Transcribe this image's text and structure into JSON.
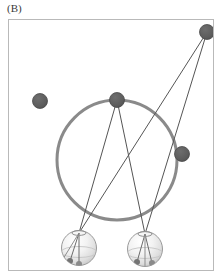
{
  "panel": {
    "label": "(B)",
    "frame": {
      "x": 8,
      "y": 19,
      "width": 206,
      "height": 252,
      "border_color": "#b9b9b9"
    },
    "background_color": "#ffffff"
  },
  "colors": {
    "ring": "#8a8a8a",
    "node_dark": "#5a5a5a",
    "node_dark_stroke": "#4a4a4a",
    "line": "#555555",
    "sphere_light": "#ffffff",
    "sphere_mid": "#e8e8e8",
    "sphere_shadow": "#bdbdbd",
    "sphere_outline": "#9a9a9a",
    "marker_dark": "#707070"
  },
  "ring": {
    "name": "gray-ring",
    "cx": 117,
    "cy": 160,
    "r": 60,
    "stroke_width": 3
  },
  "nodes": [
    {
      "id": "node-isolated-left",
      "label": "isolated-dark-node",
      "cx": 40,
      "cy": 101,
      "r": 7.5,
      "on_ring": false
    },
    {
      "id": "node-ring-top",
      "label": "ring-top-node",
      "cx": 117,
      "cy": 100,
      "r": 7.5,
      "on_ring": true
    },
    {
      "id": "node-ring-right",
      "label": "ring-right-node",
      "cx": 182,
      "cy": 154,
      "r": 7.5,
      "on_ring": true
    },
    {
      "id": "node-top-right",
      "label": "upper-right-node",
      "cx": 207,
      "cy": 32,
      "r": 7.5,
      "on_ring": false
    }
  ],
  "spheres": [
    {
      "id": "sphere-left",
      "label": "left-shaded-sphere",
      "cx": 79,
      "cy": 248,
      "r": 17.5,
      "anchor_x": 79,
      "anchor_y": 233
    },
    {
      "id": "sphere-right",
      "label": "right-shaded-sphere",
      "cx": 145,
      "cy": 249,
      "r": 17.5,
      "anchor_x": 145,
      "anchor_y": 234
    }
  ],
  "connection_lines": [
    {
      "id": "line-ringtop-to-left",
      "x1": 117,
      "y1": 100,
      "x2": 79,
      "y2": 233
    },
    {
      "id": "line-ringtop-to-right",
      "x1": 117,
      "y1": 100,
      "x2": 145,
      "y2": 234
    },
    {
      "id": "line-topright-to-left",
      "x1": 207,
      "y1": 32,
      "x2": 79,
      "y2": 233
    },
    {
      "id": "line-topright-to-right",
      "x1": 207,
      "y1": 32,
      "x2": 145,
      "y2": 234
    }
  ],
  "sphere_markers": [
    {
      "id": "marker-left-a",
      "cx": 70,
      "cy": 261,
      "r": 3.0
    },
    {
      "id": "marker-left-b",
      "cx": 79,
      "cy": 264,
      "r": 3.0
    },
    {
      "id": "marker-right-a",
      "cx": 137,
      "cy": 262,
      "r": 3.0
    },
    {
      "id": "marker-right-b",
      "cx": 152,
      "cy": 263,
      "r": 3.0
    }
  ],
  "sphere_internal_lines": [
    {
      "id": "ilines-left-1",
      "x1": 79,
      "y1": 233,
      "x2": 70,
      "y2": 261
    },
    {
      "id": "ilines-left-2",
      "x1": 79,
      "y1": 233,
      "x2": 79,
      "y2": 264
    },
    {
      "id": "ilines-left-3",
      "x1": 79,
      "y1": 233,
      "x2": 63,
      "y2": 258
    },
    {
      "id": "ilines-right-1",
      "x1": 145,
      "y1": 234,
      "x2": 137,
      "y2": 262
    },
    {
      "id": "ilines-right-2",
      "x1": 145,
      "y1": 234,
      "x2": 152,
      "y2": 263
    },
    {
      "id": "ilines-right-3",
      "x1": 145,
      "y1": 234,
      "x2": 145,
      "y2": 265
    }
  ]
}
